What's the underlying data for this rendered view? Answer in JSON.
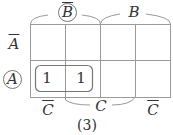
{
  "diagram": {
    "type": "karnaugh-map",
    "variables": [
      "A",
      "B",
      "C"
    ],
    "top_labels": [
      {
        "text": "B",
        "negated": true,
        "circled": true,
        "span": "columns 1-2"
      },
      {
        "text": "B",
        "negated": false,
        "circled": false,
        "span": "columns 3-4"
      }
    ],
    "row_labels": [
      {
        "text": "A",
        "negated": true,
        "circled": false
      },
      {
        "text": "A",
        "negated": false,
        "circled": true
      }
    ],
    "bottom_labels": [
      {
        "text": "C",
        "negated": true,
        "span": "column 1"
      },
      {
        "text": "C",
        "negated": false,
        "span": "columns 2-3"
      },
      {
        "text": "C",
        "negated": true,
        "span": "column 4"
      }
    ],
    "cells": [
      [
        "",
        "",
        "",
        ""
      ],
      [
        "1",
        "1",
        "",
        ""
      ]
    ],
    "group": {
      "row": 2,
      "columns": [
        1,
        2
      ],
      "term": "A·B̄"
    },
    "caption": "(3)",
    "colors": {
      "lines": "#999999",
      "text": "#333333"
    }
  }
}
